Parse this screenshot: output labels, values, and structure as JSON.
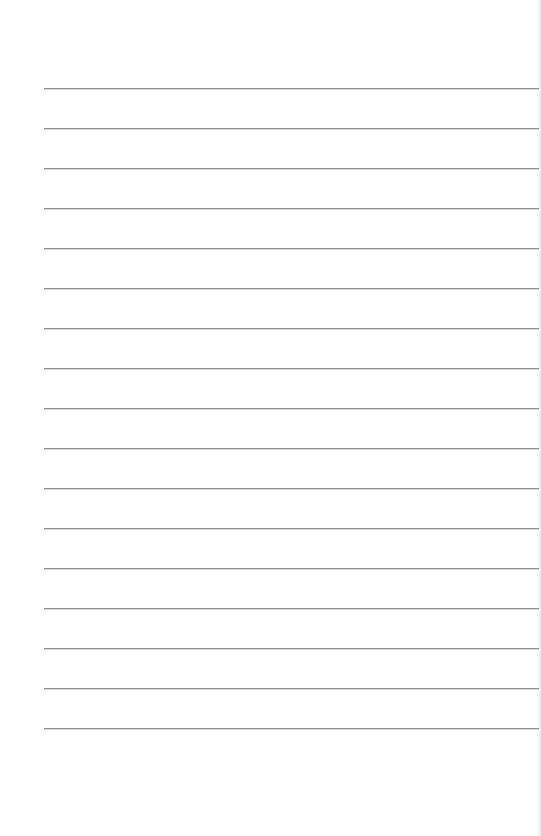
{
  "document": {
    "type": "lined-paper",
    "background_color": "#ffffff",
    "rule_color": "#8f8f8f",
    "rule_count": 17,
    "rule_left": 44,
    "rule_width": 495,
    "first_rule_y": 88,
    "rule_spacing": 40,
    "rules": [
      88,
      128,
      168,
      208,
      248,
      288,
      328,
      368,
      408,
      448,
      488,
      528,
      568,
      608,
      648,
      688,
      728
    ]
  }
}
